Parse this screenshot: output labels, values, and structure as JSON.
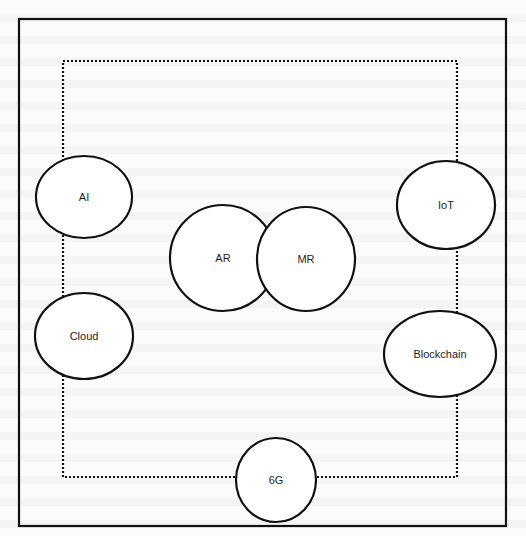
{
  "diagram": {
    "outer_frame": {
      "x": 19,
      "y": 19,
      "width": 487,
      "height": 507,
      "stroke": "#111111",
      "stroke_width": 2.2
    },
    "inner_frame": {
      "x": 63,
      "y": 61,
      "width": 394,
      "height": 416,
      "stroke": "#111111",
      "stroke_width": 2.2,
      "style": "dotted"
    },
    "nodes": [
      {
        "id": "ai",
        "label": "AI",
        "cx": 84,
        "cy": 197,
        "rx": 48,
        "ry": 41
      },
      {
        "id": "iot",
        "label": "IoT",
        "cx": 446,
        "cy": 205,
        "rx": 49,
        "ry": 44
      },
      {
        "id": "ar",
        "label": "AR",
        "cx": 223,
        "cy": 258,
        "rx": 53,
        "ry": 53
      },
      {
        "id": "mr",
        "label": "MR",
        "cx": 306,
        "cy": 259,
        "rx": 49,
        "ry": 52
      },
      {
        "id": "cloud",
        "label": "Cloud",
        "cx": 84,
        "cy": 336,
        "rx": 49,
        "ry": 43
      },
      {
        "id": "blockchain",
        "label": "Blockchain",
        "cx": 440,
        "cy": 354,
        "rx": 56,
        "ry": 43
      },
      {
        "id": "6g",
        "label": "6G",
        "cx": 276,
        "cy": 480,
        "rx": 40,
        "ry": 42
      }
    ],
    "node_stroke": "#111111",
    "node_fill": "#ffffff"
  }
}
